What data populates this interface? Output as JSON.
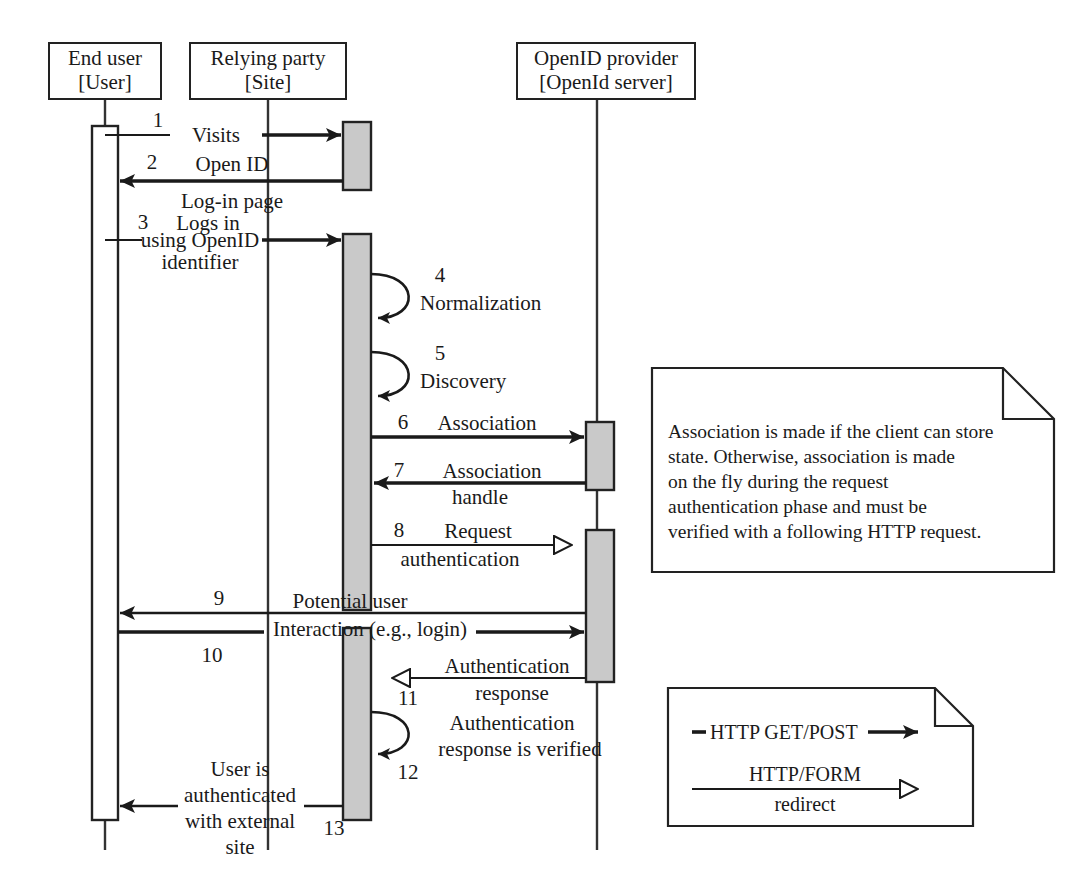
{
  "diagram": {
    "type": "uml-sequence-diagram",
    "background_color": "#ffffff",
    "line_color": "#222222",
    "activation_fill_active": "#c9c9c9",
    "activation_fill_idle": "#ffffff"
  },
  "participants": [
    {
      "id": "end-user",
      "name": "End user",
      "stereotype": "[User]",
      "lifeline_x": 105
    },
    {
      "id": "relying-party",
      "name": "Relying party",
      "stereotype": "[Site]",
      "lifeline_x": 268
    },
    {
      "id": "openid-provider",
      "name": "OpenID provider",
      "stereotype": "[OpenId server]",
      "lifeline_x": 597
    }
  ],
  "messages": [
    {
      "number": "1",
      "label_lines": [
        "Visits"
      ],
      "from": "end-user",
      "to": "relying-party",
      "arrow": "solid",
      "direction": "right"
    },
    {
      "number": "2",
      "label_lines": [
        "Open ID",
        "Log-in page"
      ],
      "from": "relying-party",
      "to": "end-user",
      "arrow": "solid",
      "direction": "left"
    },
    {
      "number": "3",
      "label_lines": [
        "Logs in",
        "using OpenID",
        "identifier"
      ],
      "from": "end-user",
      "to": "relying-party",
      "arrow": "solid",
      "direction": "right"
    },
    {
      "number": "4",
      "label_lines": [
        "Normalization"
      ],
      "from": "relying-party",
      "to": "relying-party",
      "arrow": "solid",
      "direction": "self"
    },
    {
      "number": "5",
      "label_lines": [
        "Discovery"
      ],
      "from": "relying-party",
      "to": "relying-party",
      "arrow": "solid",
      "direction": "self"
    },
    {
      "number": "6",
      "label_lines": [
        "Association"
      ],
      "from": "relying-party",
      "to": "openid-provider",
      "arrow": "solid",
      "direction": "right"
    },
    {
      "number": "7",
      "label_lines": [
        "Association",
        "handle"
      ],
      "from": "openid-provider",
      "to": "relying-party",
      "arrow": "solid",
      "direction": "left"
    },
    {
      "number": "8",
      "label_lines": [
        "Request",
        "authentication"
      ],
      "from": "relying-party",
      "to": "openid-provider",
      "arrow": "hollow",
      "direction": "right"
    },
    {
      "number": "9",
      "label_lines": [
        "Potential user"
      ],
      "from": "openid-provider",
      "to": "end-user",
      "arrow": "solid",
      "direction": "left"
    },
    {
      "number": "10",
      "label_lines": [
        "Interaction (e.g., login)"
      ],
      "from": "end-user",
      "to": "openid-provider",
      "arrow": "solid",
      "direction": "right"
    },
    {
      "number": "11",
      "label_lines": [
        "Authentication",
        "response"
      ],
      "from": "openid-provider",
      "to": "relying-party",
      "arrow": "hollow",
      "direction": "left"
    },
    {
      "number": "12",
      "label_lines": [
        "Authentication",
        "response is verified"
      ],
      "from": "relying-party",
      "to": "relying-party",
      "arrow": "solid",
      "direction": "self"
    },
    {
      "number": "13",
      "label_lines": [
        "User is",
        "authenticated",
        "with external",
        "site"
      ],
      "from": "relying-party",
      "to": "end-user",
      "arrow": "solid",
      "direction": "left"
    }
  ],
  "note": {
    "id": "association-note",
    "lines": [
      "Association is made if the client can store",
      "state. Otherwise, association is made",
      "on the fly during the request",
      "authentication phase and must be",
      "verified with a following HTTP request."
    ]
  },
  "legend": {
    "id": "arrow-legend",
    "entries": [
      {
        "label_lines": [
          "HTTP GET/POST"
        ],
        "arrow": "solid"
      },
      {
        "label_lines": [
          "HTTP/FORM",
          "redirect"
        ],
        "arrow": "hollow"
      }
    ]
  }
}
